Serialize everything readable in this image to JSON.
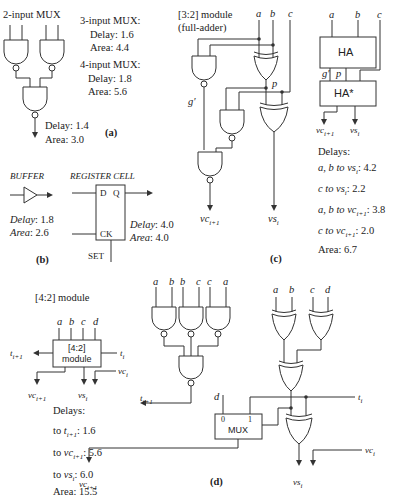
{
  "panel_a": {
    "title": "2-input MUX",
    "mux2_delay": "Delay: 1.4",
    "mux2_area": "Area: 3.0",
    "mux3_title": "3-input MUX:",
    "mux3_delay": "Delay: 1.6",
    "mux3_area": "Area: 4.4",
    "mux4_title": "4-input MUX:",
    "mux4_delay": "Delay: 1.8",
    "mux4_area": "Area: 5.6",
    "label": "(a)"
  },
  "panel_b": {
    "buffer_title": "BUFFER",
    "buffer_delay_label": "Delay",
    "buffer_delay": ": 1.8",
    "buffer_area_label": "Area",
    "buffer_area": ": 2.6",
    "reg_title": "REGISTER CELL",
    "reg_d": "D",
    "reg_q": "Q",
    "reg_ck": "CK",
    "reg_set": "SET",
    "reg_delay_label": "Delay",
    "reg_delay": ": 4.0",
    "reg_area_label": "Area",
    "reg_area": ": 4.0",
    "label": "(b)"
  },
  "panel_c": {
    "title_line1": "[3:2] module",
    "title_line2": "(full-adder)",
    "in_a": "a",
    "in_b": "b",
    "in_c": "c",
    "g_prime": "g′",
    "p": "p",
    "out_vc": "vc",
    "out_vc_sub": "i+1",
    "out_vs": "vs",
    "out_vs_sub": "i",
    "block_ha": "HA",
    "block_ha_star": "HA*",
    "block_in_a": "a",
    "block_in_b": "b",
    "block_in_c": "c",
    "block_g": "g′",
    "block_p": "p",
    "delays_title": "Delays:",
    "delays": [
      {
        "from": "a, b to vs",
        "sub": "i",
        "value": ": 4.2"
      },
      {
        "from": "c to vs",
        "sub": "i",
        "value": ": 2.2"
      },
      {
        "from": "a, b to vc",
        "sub": "i+1",
        "value": ": 3.8"
      },
      {
        "from": "c to vc",
        "sub": "i+1",
        "value": ": 2.0"
      }
    ],
    "area": "Area: 6.7",
    "label": "(c)"
  },
  "panel_d": {
    "title": "[4:2] module",
    "box_line1": "[4:2]",
    "box_line2": "module",
    "in_a": "a",
    "in_b": "b",
    "in_c": "c",
    "in_d": "d",
    "t_out": "t",
    "t_out_sub": "i+1",
    "t_in": "t",
    "t_in_sub": "i",
    "vc_in": "vc",
    "vc_in_sub": "i",
    "vc_out": "vc",
    "vc_out_sub": "i+1",
    "vs_out": "vs",
    "vs_out_sub": "i",
    "delays_title": "Delays:",
    "delays": [
      {
        "to": "to ",
        "sig": "t",
        "sub": "i+1",
        "value": ": 1.6"
      },
      {
        "to": "to ",
        "sig": "vc",
        "sub": "i+1",
        "value": ": 5.6"
      },
      {
        "to": "to ",
        "sig": "vs",
        "sub": "i",
        "value": ": 6.0"
      }
    ],
    "area": "Area: 15.5",
    "nand_inputs": [
      "a",
      "b",
      "b",
      "c",
      "c",
      "a"
    ],
    "xor_inputs": [
      "a",
      "b",
      "c",
      "d"
    ],
    "mux_label": "MUX",
    "mux_in0": "0",
    "mux_in1": "1",
    "mux_d": "d",
    "label": "(d)"
  }
}
